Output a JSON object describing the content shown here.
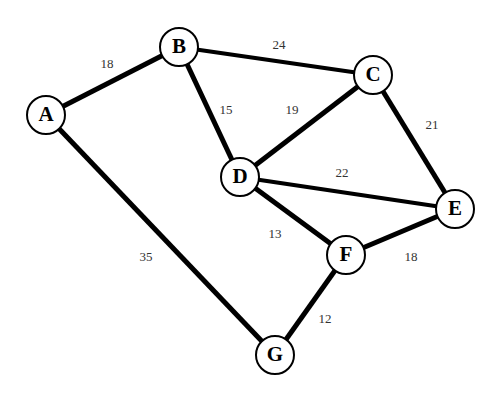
{
  "graph": {
    "type": "weighted-undirected-graph",
    "nodes": [
      {
        "id": "A",
        "label": "A",
        "x": 46,
        "y": 115
      },
      {
        "id": "B",
        "label": "B",
        "x": 179,
        "y": 47
      },
      {
        "id": "C",
        "label": "C",
        "x": 373,
        "y": 75
      },
      {
        "id": "D",
        "label": "D",
        "x": 240,
        "y": 177
      },
      {
        "id": "E",
        "label": "E",
        "x": 455,
        "y": 209
      },
      {
        "id": "F",
        "label": "F",
        "x": 346,
        "y": 255
      },
      {
        "id": "G",
        "label": "G",
        "x": 275,
        "y": 355
      }
    ],
    "edges": [
      {
        "from": "A",
        "to": "B",
        "weight": "18",
        "lx": 107,
        "ly": 65,
        "w": 5
      },
      {
        "from": "B",
        "to": "C",
        "weight": "24",
        "lx": 279,
        "ly": 46,
        "w": 4
      },
      {
        "from": "B",
        "to": "D",
        "weight": "15",
        "lx": 226,
        "ly": 111,
        "w": 5
      },
      {
        "from": "C",
        "to": "D",
        "weight": "19",
        "lx": 292,
        "ly": 111,
        "w": 5
      },
      {
        "from": "C",
        "to": "E",
        "weight": "21",
        "lx": 432,
        "ly": 126,
        "w": 5
      },
      {
        "from": "D",
        "to": "E",
        "weight": "22",
        "lx": 342,
        "ly": 174,
        "w": 4
      },
      {
        "from": "D",
        "to": "F",
        "weight": "13",
        "lx": 275,
        "ly": 235,
        "w": 5
      },
      {
        "from": "E",
        "to": "F",
        "weight": "18",
        "lx": 411,
        "ly": 258,
        "w": 5
      },
      {
        "from": "F",
        "to": "G",
        "weight": "12",
        "lx": 325,
        "ly": 320,
        "w": 5
      },
      {
        "from": "A",
        "to": "G",
        "weight": "35",
        "lx": 146,
        "ly": 258,
        "w": 5
      }
    ],
    "node_radius": 19,
    "colors": {
      "stroke": "#000000",
      "fill": "#ffffff",
      "label": "#333333"
    }
  }
}
